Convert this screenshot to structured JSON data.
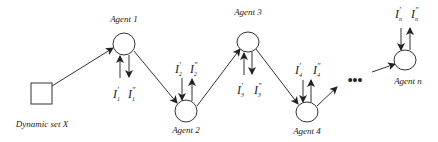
{
  "diagram": {
    "source": {
      "label": "Dynamic set X",
      "shape": "square"
    },
    "agents": [
      {
        "label": "Agent 1",
        "in_label": "I",
        "in_sub": "1",
        "in_prime": "′",
        "out_label": "I",
        "out_sub": "1",
        "out_prime": "″"
      },
      {
        "label": "Agent 2",
        "in_label": "I",
        "in_sub": "2",
        "in_prime": "′",
        "out_label": "I",
        "out_sub": "2",
        "out_prime": "″"
      },
      {
        "label": "Agent 3",
        "in_label": "I",
        "in_sub": "3",
        "in_prime": "′",
        "out_label": "I",
        "out_sub": "3",
        "out_prime": "″"
      },
      {
        "label": "Agent 4",
        "in_label": "I",
        "in_sub": "4",
        "in_prime": "′",
        "out_label": "I",
        "out_sub": "4",
        "out_prime": "″"
      },
      {
        "label": "Agent n",
        "in_label": "I",
        "in_sub": "n",
        "in_prime": "′",
        "out_label": "I",
        "out_sub": "n",
        "out_prime": "″"
      }
    ],
    "ellipsis": "•••",
    "edges": [
      {
        "from": "Dynamic set X",
        "to": "Agent 1"
      },
      {
        "from": "Agent 1",
        "to": "Agent 2"
      },
      {
        "from": "Agent 2",
        "to": "Agent 3"
      },
      {
        "from": "Agent 3",
        "to": "Agent 4"
      },
      {
        "from": "Agent 4",
        "to": "…"
      },
      {
        "from": "…",
        "to": "Agent n"
      }
    ],
    "colors": {
      "stroke": "#333333",
      "background": "#ffffff",
      "text": "#222222"
    }
  }
}
